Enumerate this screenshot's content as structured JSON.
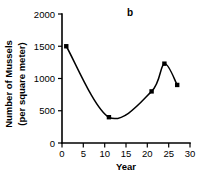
{
  "chart_data": {
    "type": "line",
    "title": "",
    "panel_label": "b",
    "xlabel": "Year",
    "ylabel_line1": "Number of Mussels",
    "ylabel_line2": "(per square meter)",
    "xlim": [
      0,
      30
    ],
    "ylim": [
      0,
      2000
    ],
    "xticks": [
      0,
      5,
      10,
      15,
      20,
      25,
      30
    ],
    "xtick_labels": [
      "0",
      "5",
      "10",
      "15",
      "20",
      "25",
      "30"
    ],
    "yticks": [
      0,
      500,
      1000,
      1500,
      2000
    ],
    "ytick_labels": [
      "0",
      "500",
      "1000",
      "1500",
      "2000"
    ],
    "grid": false,
    "legend": false,
    "marker": "square",
    "line_color": "#000000",
    "marker_color": "#000000",
    "x": [
      1,
      11,
      21,
      24,
      27
    ],
    "values": [
      1500,
      400,
      800,
      1230,
      900
    ],
    "points": [
      {
        "x": 1,
        "y": 1500
      },
      {
        "x": 11,
        "y": 400
      },
      {
        "x": 21,
        "y": 800
      },
      {
        "x": 24,
        "y": 1230
      },
      {
        "x": 27,
        "y": 900
      }
    ]
  }
}
